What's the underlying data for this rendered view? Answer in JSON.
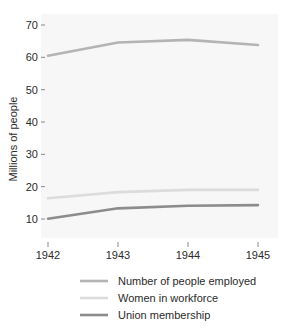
{
  "chart_data": {
    "type": "line",
    "title": "",
    "subtitle": "",
    "xlabel": "",
    "ylabel": "Millions of people",
    "x": [
      1942,
      1943,
      1944,
      1945
    ],
    "categories": [
      "1942",
      "1943",
      "1944",
      "1945"
    ],
    "xtick_labels": [
      "1942",
      "1943",
      "1944",
      "1945"
    ],
    "ytick_labels": [
      "10",
      "20",
      "30",
      "40",
      "50",
      "60",
      "70"
    ],
    "ytick_values": [
      10,
      20,
      30,
      40,
      50,
      60,
      70
    ],
    "xlim": [
      1942,
      1945
    ],
    "ylim": [
      5,
      72
    ],
    "grid": false,
    "legend_position": "bottom",
    "background_color": "#f7f7f7",
    "series": [
      {
        "name": "Number of people employed",
        "values": [
          60.5,
          64.6,
          65.4,
          63.8
        ],
        "color": "#b4b4b4",
        "line_width": 2.6
      },
      {
        "name": "Women in workforce",
        "values": [
          16.4,
          18.3,
          19.0,
          19.0
        ],
        "color": "#dcdcdc",
        "line_width": 2.6
      },
      {
        "name": "Union membership",
        "values": [
          10.1,
          13.3,
          14.1,
          14.3
        ],
        "color": "#8c8c8c",
        "line_width": 2.6
      }
    ]
  },
  "axes": {
    "y_title": "Millions of people",
    "y_ticks": [
      {
        "label": "70",
        "value": 70
      },
      {
        "label": "60",
        "value": 60
      },
      {
        "label": "50",
        "value": 50
      },
      {
        "label": "40",
        "value": 40
      },
      {
        "label": "30",
        "value": 30
      },
      {
        "label": "20",
        "value": 20
      },
      {
        "label": "10",
        "value": 10
      }
    ],
    "x_ticks": [
      {
        "label": "1942",
        "value": 1942
      },
      {
        "label": "1943",
        "value": 1943
      },
      {
        "label": "1944",
        "value": 1944
      },
      {
        "label": "1945",
        "value": 1945
      }
    ]
  },
  "legend": {
    "items": [
      {
        "label": "Number of people employed",
        "color": "#b4b4b4"
      },
      {
        "label": "Women in workforce",
        "color": "#dcdcdc"
      },
      {
        "label": "Union membership",
        "color": "#8c8c8c"
      }
    ]
  }
}
